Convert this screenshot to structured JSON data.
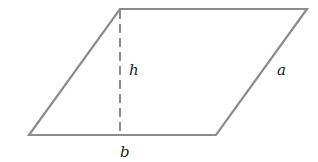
{
  "diagram": {
    "shape": "parallelogram",
    "vertices": [
      [
        29,
        135
      ],
      [
        216,
        135
      ],
      [
        307,
        9
      ],
      [
        120,
        9
      ]
    ],
    "height_line": {
      "x": 120,
      "y1": 9,
      "y2": 135,
      "style": "dashed"
    },
    "labels": {
      "height": "h",
      "side": "a",
      "base": "b"
    },
    "colors": {
      "stroke": "#8c8c8c",
      "text": "#222222",
      "background": "#ffffff"
    }
  }
}
